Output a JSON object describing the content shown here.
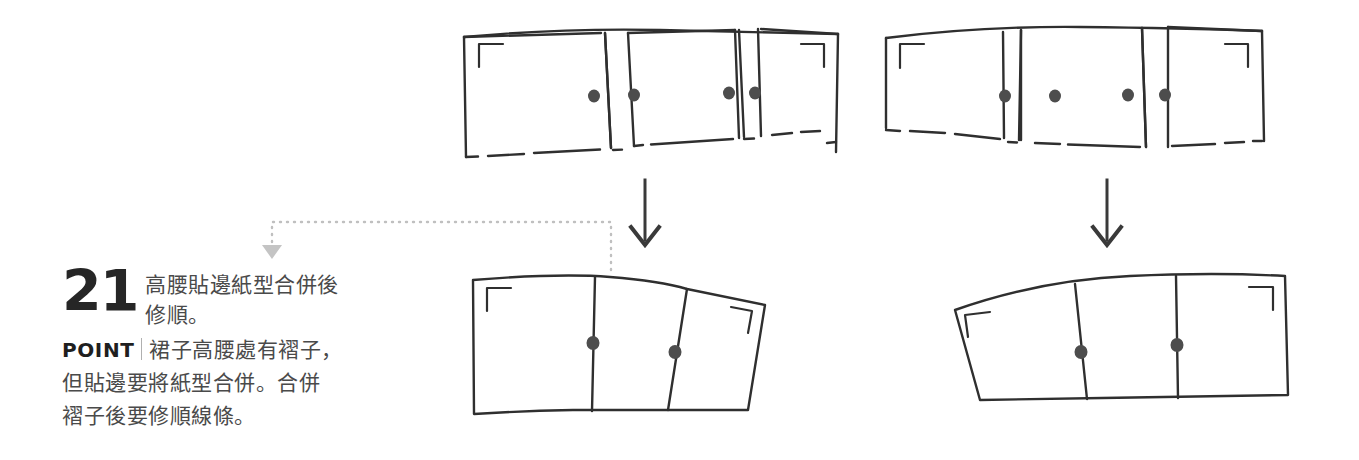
{
  "page": {
    "width": 1359,
    "height": 460,
    "background": "#ffffff",
    "type": "sewing-pattern-instruction-diagram"
  },
  "instruction": {
    "step_number": "21",
    "step_description_line1": "高腰貼邊紙型合併後",
    "step_description_line2": "修順。",
    "point_tag": "POINT",
    "point_body_line1": "裙子高腰處有褶子，",
    "point_body_line2": "但貼邊要將紙型合併。合併",
    "point_body_line3": "褶子後要修順線條。"
  },
  "colors": {
    "ink": "#262626",
    "line": "#3a3a3a",
    "text": "#4a4a4a",
    "dotted_guide": "#b9b9b9",
    "notch": "#4d4d4d",
    "divider": "#b0b0b0"
  },
  "diagram": {
    "panels": [
      {
        "name": "top-left-pattern",
        "label": "front facing pattern with pleat wedges",
        "position": "top-left",
        "pieces": 3,
        "wedge_gaps": 2,
        "notches": 4,
        "corner_marks": 2,
        "edges": "dashed-hem"
      },
      {
        "name": "top-right-pattern",
        "label": "back facing pattern with pleat wedges",
        "position": "top-right",
        "pieces": 3,
        "wedge_gaps": 2,
        "notches": 4,
        "corner_marks": 2,
        "edges": "dashed-hem"
      },
      {
        "name": "bottom-left-pattern",
        "label": "merged front facing pattern",
        "position": "bottom-left",
        "pieces": 3,
        "wedge_gaps": 0,
        "notches": 2,
        "corner_marks": 2,
        "edges": "solid-smoothed"
      },
      {
        "name": "bottom-right-pattern",
        "label": "merged back facing pattern",
        "position": "bottom-right",
        "pieces": 3,
        "wedge_gaps": 0,
        "notches": 2,
        "corner_marks": 2,
        "edges": "solid-smoothed"
      }
    ],
    "arrows": [
      {
        "name": "arrow-left-down",
        "from": "top-left-pattern",
        "to": "bottom-left-pattern",
        "style": "solid-black"
      },
      {
        "name": "arrow-right-down",
        "from": "top-right-pattern",
        "to": "bottom-right-pattern",
        "style": "solid-black"
      }
    ],
    "connectors": [
      {
        "name": "dotted-callout",
        "from": "bottom-left-pattern",
        "to": "instruction-block",
        "style": "gray-dotted-with-triangle-arrowhead"
      }
    ]
  }
}
